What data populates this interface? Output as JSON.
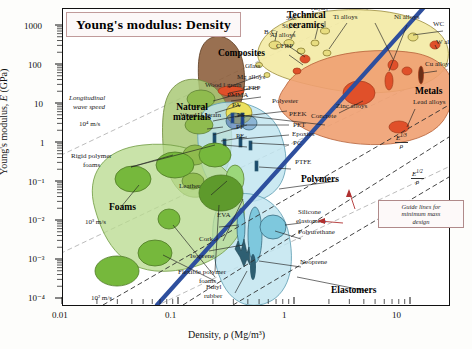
{
  "chart_data": {
    "type": "scatter",
    "title": "Young's modulus: Density",
    "xlabel": "Density, ρ (Mg/m³)",
    "ylabel": "Young's modulus, E (GPa)",
    "xlim": [
      0.01,
      30
    ],
    "ylim": [
      0.0001,
      2000
    ],
    "xscale": "log",
    "yscale": "log",
    "grid": false,
    "xticks": [
      "0.01",
      "0.1",
      "1",
      "10"
    ],
    "yticks": [
      "1000",
      "100",
      "10",
      "1",
      "10⁻¹",
      "10⁻²",
      "10⁻³",
      "10⁻⁴"
    ],
    "families": [
      {
        "name": "Technical ceramics",
        "color": "#f2e9a8",
        "label_x": 286,
        "label_y": 6
      },
      {
        "name": "Composites",
        "color": "#8a5b3a",
        "label_x": 219,
        "label_y": 44
      },
      {
        "name": "Metals",
        "color": "#ef9a6a",
        "label_x": 415,
        "label_y": 82
      },
      {
        "name": "Natural materials",
        "color": "#a8c878",
        "label_x": 175,
        "label_y": 99
      },
      {
        "name": "Polymers",
        "color": "#bfe4ef",
        "label_x": 300,
        "label_y": 171
      },
      {
        "name": "Elastomers",
        "color": "#bfe4ef",
        "label_x": 330,
        "label_y": 281
      },
      {
        "name": "Foams",
        "color": "#b4d98a",
        "label_x": 46,
        "label_y": 198
      }
    ],
    "material_labels": [
      {
        "text": "B₄C",
        "x": 263,
        "y": 28
      },
      {
        "text": "Si₃N₄",
        "x": 281,
        "y": 22
      },
      {
        "text": "SiC",
        "x": 285,
        "y": 14
      },
      {
        "text": "Al₂O₃",
        "x": 310,
        "y": 4
      },
      {
        "text": "Ti alloys",
        "x": 332,
        "y": 13
      },
      {
        "text": "Steels",
        "x": 365,
        "y": 3
      },
      {
        "text": "Ni alloys",
        "x": 393,
        "y": 13
      },
      {
        "text": "WC",
        "x": 432,
        "y": 20
      },
      {
        "text": "W alloys",
        "x": 435,
        "y": 38
      },
      {
        "text": "Cu alloys",
        "x": 424,
        "y": 60
      },
      {
        "text": "Lead alloys",
        "x": 412,
        "y": 98
      },
      {
        "text": "Zinc alloys",
        "x": 335,
        "y": 102
      },
      {
        "text": "Concrete",
        "x": 310,
        "y": 112
      },
      {
        "text": "Al alloys",
        "x": 269,
        "y": 31
      },
      {
        "text": "CFRP",
        "x": 275,
        "y": 42
      },
      {
        "text": "Glass",
        "x": 244,
        "y": 62
      },
      {
        "text": "Mg alloys",
        "x": 236,
        "y": 73
      },
      {
        "text": "GFRP",
        "x": 242,
        "y": 84
      },
      {
        "text": "Wood ‖ grain",
        "x": 204,
        "y": 81
      },
      {
        "text": "PMMA",
        "x": 226,
        "y": 91
      },
      {
        "text": "PA",
        "x": 231,
        "y": 101
      },
      {
        "text": "Polyester",
        "x": 271,
        "y": 97
      },
      {
        "text": "PEEK",
        "x": 288,
        "y": 110
      },
      {
        "text": "PET",
        "x": 292,
        "y": 121
      },
      {
        "text": "Epoxies",
        "x": 291,
        "y": 130
      },
      {
        "text": "PC",
        "x": 292,
        "y": 139
      },
      {
        "text": "PTFE",
        "x": 294,
        "y": 158
      },
      {
        "text": "PS",
        "x": 236,
        "y": 111
      },
      {
        "text": "PP",
        "x": 235,
        "y": 123
      },
      {
        "text": "PE",
        "x": 235,
        "y": 132
      },
      {
        "text": "Wood ⊥ grain",
        "x": 179,
        "y": 111
      },
      {
        "text": "Leather",
        "x": 178,
        "y": 182
      },
      {
        "text": "Cork",
        "x": 198,
        "y": 235
      },
      {
        "text": "Isoprene",
        "x": 189,
        "y": 252
      },
      {
        "text": "EVA",
        "x": 216,
        "y": 211
      },
      {
        "text": "Silicone",
        "x": 297,
        "y": 208
      },
      {
        "text": "elastomers",
        "x": 295,
        "y": 217
      },
      {
        "text": "Polyurethane",
        "x": 297,
        "y": 228
      },
      {
        "text": "Neoprene",
        "x": 299,
        "y": 258
      },
      {
        "text": "Butyl",
        "x": 205,
        "y": 283
      },
      {
        "text": "rubber",
        "x": 203,
        "y": 292
      },
      {
        "text": "Rigid polymer",
        "x": 70,
        "y": 152
      },
      {
        "text": "foams",
        "x": 82,
        "y": 161
      },
      {
        "text": "Flexible polymer",
        "x": 177,
        "y": 268
      },
      {
        "text": "foams",
        "x": 198,
        "y": 277
      }
    ],
    "annotations": {
      "wave_speed_title_1": "Longitudinal",
      "wave_speed_title_2": "wave speed",
      "wave_speed_values": [
        "10⁴ m/s",
        "10³ m/s",
        "10² m/s"
      ],
      "guide_box_line1": "Guide lines for",
      "guide_box_line2": "minimum mass",
      "guide_box_line3": "design",
      "guide_lines": [
        {
          "num": "E",
          "exp": "1/3",
          "den": "ρ"
        },
        {
          "num": "E",
          "exp": "1/2",
          "den": "ρ"
        },
        {
          "num": "E",
          "exp": "",
          "den": "ρ"
        }
      ]
    },
    "colors": {
      "ceramics": "#f2e9a8",
      "metals": "#ef9a6a",
      "composites": "#8a5b3a",
      "polymers": "#bfe4ef",
      "foams": "#b4d98a",
      "natural": "#a8c878",
      "modulus_line": "#2e4f9e",
      "guide_line": "#333333",
      "wave_line": "#b9b9b9",
      "title_border": "#c09a9a"
    }
  }
}
